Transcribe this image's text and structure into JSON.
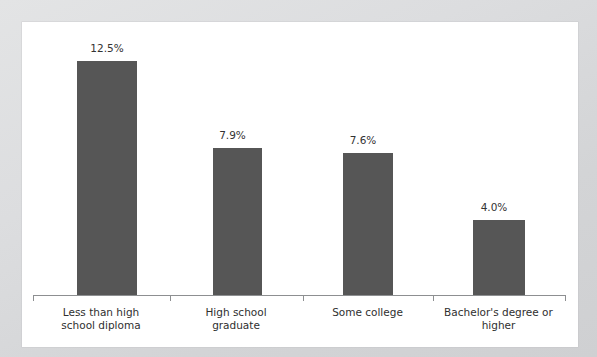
{
  "scan": {
    "top_clipped_text": "",
    "background_color": "#d8d9da",
    "card_color": "#ffffff"
  },
  "chart_data": {
    "type": "bar",
    "title": "",
    "subtitle": "",
    "xlabel": "",
    "ylabel": "",
    "categories": [
      "Less than high\nschool diploma",
      "High school\ngraduate",
      "Some college",
      "Bachelor's degree or\nhigher"
    ],
    "values": [
      12.5,
      7.9,
      7.6,
      4.0
    ],
    "value_labels": [
      "12.5%",
      "7.9%",
      "7.6%",
      "4.0%"
    ],
    "ylim": [
      0,
      14.6
    ],
    "grid": false,
    "legend": "none",
    "bar_color": "#565656",
    "axis_color": "#8d8f91",
    "text_color": "#2f2f2f",
    "units": "percent"
  },
  "axis": {
    "tick_count": 5,
    "tick_positions_px": [
      11,
      148,
      281,
      411,
      543
    ],
    "baseline_y_px": 273
  },
  "bars": [
    {
      "name": "bar-less-than-high-school",
      "left_px": 55,
      "width_px": 60,
      "height_px": 234,
      "label_left_px": 55,
      "label_top_px": 20
    },
    {
      "name": "bar-high-school-graduate",
      "left_px": 191,
      "width_px": 49,
      "height_px": 147,
      "label_left_px": 186,
      "label_top_px": 107
    },
    {
      "name": "bar-some-college",
      "left_px": 321,
      "width_px": 50,
      "height_px": 142,
      "label_left_px": 316,
      "label_top_px": 112
    },
    {
      "name": "bar-bachelors-or-higher",
      "left_px": 451,
      "width_px": 52,
      "height_px": 75,
      "label_left_px": 446,
      "label_top_px": 179
    }
  ],
  "category_label_boxes": [
    {
      "left_px": 10,
      "width_px": 138
    },
    {
      "left_px": 147,
      "width_px": 134
    },
    {
      "left_px": 280,
      "width_px": 131
    },
    {
      "left_px": 410,
      "width_px": 133
    }
  ]
}
